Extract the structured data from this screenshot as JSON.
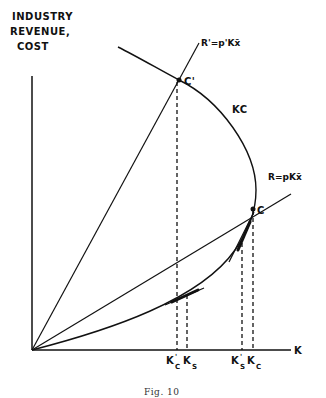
{
  "figure": {
    "caption": "Fig. 10",
    "y_axis_label": [
      "INDUSTRY",
      "REVENUE,",
      "COST"
    ],
    "x_axis_label": "K",
    "curves": {
      "kc_label": "KC",
      "r_prime_label": "R'=p'Kx̄",
      "r_label": "R=pKx̄"
    },
    "points": {
      "c_prime": "C'",
      "c": "C"
    },
    "x_ticks": [
      {
        "main": "K",
        "sup": "'",
        "sub": "C"
      },
      {
        "main": "K",
        "sup": "",
        "sub": "S"
      },
      {
        "main": "K",
        "sup": "'",
        "sub": "S"
      },
      {
        "main": "K",
        "sup": "",
        "sub": "C"
      }
    ]
  }
}
